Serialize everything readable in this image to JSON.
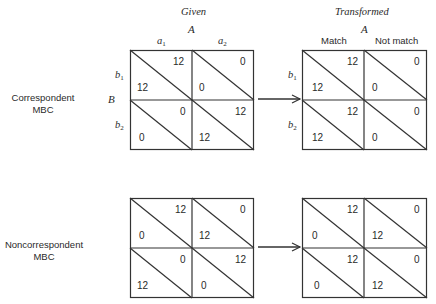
{
  "headers": {
    "given": "Given",
    "transformed": "Transformed",
    "factor_a": "A",
    "factor_b": "B"
  },
  "given_columns": [
    {
      "base": "a",
      "sub": "1"
    },
    {
      "base": "a",
      "sub": "2"
    }
  ],
  "transformed_columns": [
    "Match",
    "Not match"
  ],
  "row_levels": [
    {
      "base": "b",
      "sub": "1"
    },
    {
      "base": "b",
      "sub": "2"
    }
  ],
  "rows": [
    {
      "label_line1": "Correspondent",
      "label_line2": "MBC",
      "given": {
        "cells": [
          {
            "upper": "12",
            "lower": "12"
          },
          {
            "upper": "0",
            "lower": "0"
          },
          {
            "upper": "0",
            "lower": "0"
          },
          {
            "upper": "12",
            "lower": "12"
          }
        ]
      },
      "transformed": {
        "cells": [
          {
            "upper": "12",
            "lower": "12"
          },
          {
            "upper": "0",
            "lower": "0"
          },
          {
            "upper": "12",
            "lower": "12"
          },
          {
            "upper": "0",
            "lower": "0"
          }
        ]
      }
    },
    {
      "label_line1": "Noncorrespondent",
      "label_line2": "MBC",
      "given": {
        "cells": [
          {
            "upper": "12",
            "lower": "0"
          },
          {
            "upper": "0",
            "lower": "12"
          },
          {
            "upper": "0",
            "lower": "12"
          },
          {
            "upper": "12",
            "lower": "0"
          }
        ]
      },
      "transformed": {
        "cells": [
          {
            "upper": "12",
            "lower": "0"
          },
          {
            "upper": "0",
            "lower": "12"
          },
          {
            "upper": "12",
            "lower": "0"
          },
          {
            "upper": "0",
            "lower": "12"
          }
        ]
      }
    }
  ]
}
